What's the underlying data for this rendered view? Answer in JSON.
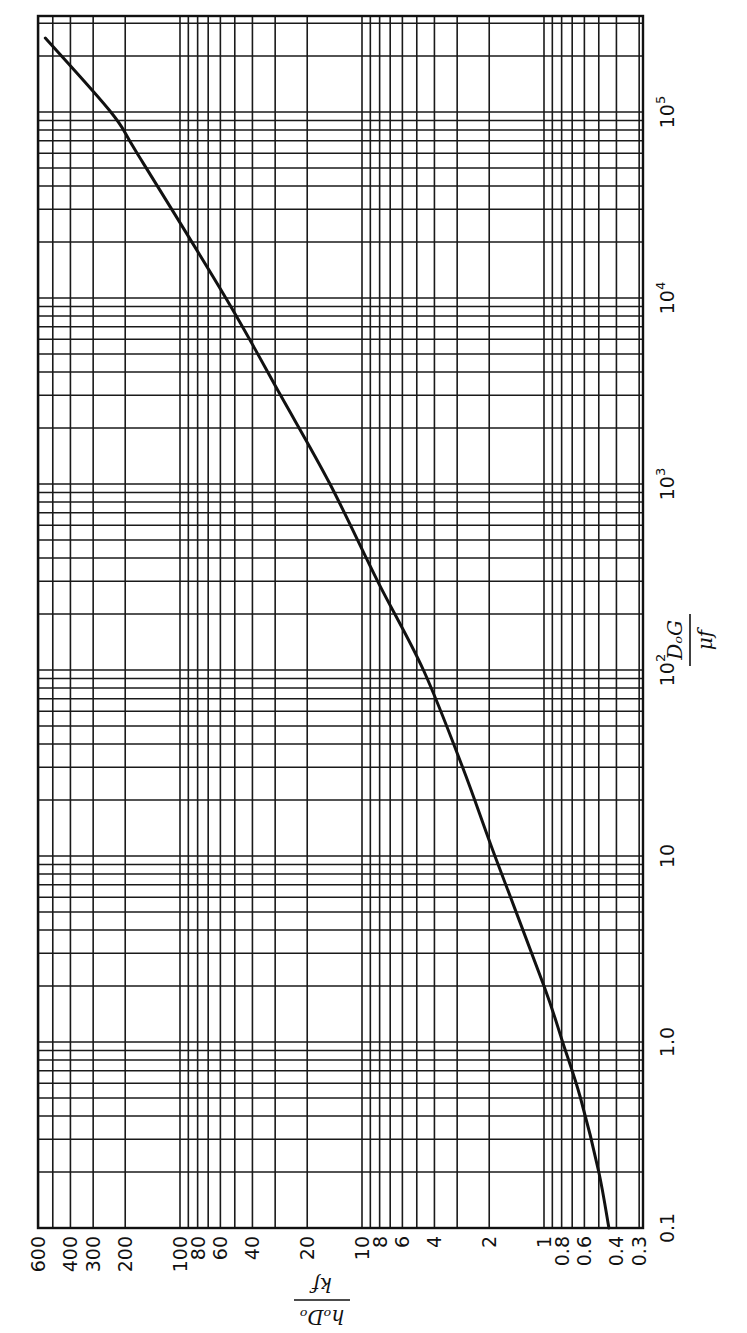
{
  "chart_data": {
    "type": "line",
    "orientation": "rotated-90-ccw",
    "scale": {
      "x": "log",
      "y": "log"
    },
    "title": "",
    "xlabel": "D_o G / μ_f",
    "ylabel": "h_o D_o / k_f",
    "xlabel_parts": {
      "numerator": "DₒG",
      "denominator": "μf"
    },
    "ylabel_parts": {
      "numerator": "hₒDₒ",
      "denominator": "kf"
    },
    "xlim": [
      0.1,
      320000
    ],
    "ylim": [
      0.3,
      600
    ],
    "grid": true,
    "x_tick_labels": [
      {
        "value": 0.1,
        "label": "0.1"
      },
      {
        "value": 1,
        "label": "1.0"
      },
      {
        "value": 10,
        "label": "10"
      },
      {
        "value": 100,
        "label": "10",
        "exp": "2"
      },
      {
        "value": 1000,
        "label": "10",
        "exp": "3"
      },
      {
        "value": 10000,
        "label": "10",
        "exp": "4"
      },
      {
        "value": 100000,
        "label": "10",
        "exp": "5"
      }
    ],
    "y_tick_labels": [
      {
        "value": 600,
        "label": "600"
      },
      {
        "value": 400,
        "label": "400"
      },
      {
        "value": 300,
        "label": "300"
      },
      {
        "value": 200,
        "label": "200"
      },
      {
        "value": 100,
        "label": "100"
      },
      {
        "value": 80,
        "label": "80"
      },
      {
        "value": 60,
        "label": "60"
      },
      {
        "value": 40,
        "label": "40"
      },
      {
        "value": 20,
        "label": "20"
      },
      {
        "value": 10,
        "label": "10"
      },
      {
        "value": 8,
        "label": "8"
      },
      {
        "value": 6,
        "label": "6"
      },
      {
        "value": 4,
        "label": "4"
      },
      {
        "value": 2,
        "label": "2"
      },
      {
        "value": 1,
        "label": "1"
      },
      {
        "value": 0.8,
        "label": "0.8"
      },
      {
        "value": 0.6,
        "label": "0.6"
      },
      {
        "value": 0.4,
        "label": "0.4"
      },
      {
        "value": 0.3,
        "label": "0.3"
      }
    ],
    "series": [
      {
        "name": "h_o D_o / k_f vs D_o G / μ_f",
        "x": [
          0.1,
          0.2,
          0.5,
          1,
          2,
          10,
          30,
          100,
          300,
          1000,
          3000,
          10000,
          60000,
          100000,
          250000
        ],
        "y": [
          0.44,
          0.5,
          0.63,
          0.79,
          1.0,
          1.86,
          2.8,
          4.6,
          8.2,
          15,
          28,
          56,
          172,
          240,
          550
        ]
      }
    ]
  },
  "layout": {
    "plot_left": 38,
    "plot_right": 643,
    "plot_top": 16,
    "plot_bottom": 1228,
    "x_px_per_decade": 186,
    "x_one_at": 1042,
    "y_px_per_decade": 182,
    "y_one_at": 544
  },
  "colors": {
    "ink": "#111111",
    "paper": "#ffffff"
  }
}
